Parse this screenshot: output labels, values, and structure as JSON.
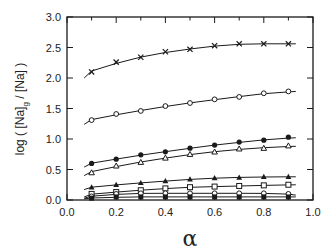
{
  "chart_data": {
    "type": "scatter",
    "title": "",
    "xlabel": "α",
    "ylabel": "log ( [Na]g / [Na] )",
    "ylabel_main": "log ( [Na]",
    "ylabel_sub": "g",
    "ylabel_tail": " / [Na] )",
    "xlim": [
      0.0,
      1.0
    ],
    "ylim": [
      0.0,
      3.0
    ],
    "xticks": [
      "0.0",
      "0.2",
      "0.4",
      "0.6",
      "0.8",
      "1.0"
    ],
    "yticks": [
      "0.0",
      "0.5",
      "1.0",
      "1.5",
      "2.0",
      "2.5",
      "3.0"
    ],
    "grid": false,
    "legend": "none",
    "x": [
      0.1,
      0.2,
      0.3,
      0.4,
      0.5,
      0.6,
      0.7,
      0.8,
      0.9
    ],
    "series": [
      {
        "name": "cross",
        "marker": "x",
        "values": [
          2.1,
          2.26,
          2.34,
          2.43,
          2.47,
          2.53,
          2.56,
          2.56,
          2.56
        ],
        "fit_start": 2.0,
        "fit_end": 2.56
      },
      {
        "name": "open-circle",
        "marker": "open-circle",
        "values": [
          1.31,
          1.41,
          1.46,
          1.54,
          1.59,
          1.65,
          1.69,
          1.75,
          1.78
        ],
        "fit_start": 1.24,
        "fit_end": 1.78
      },
      {
        "name": "filled-circle",
        "marker": "filled-circle",
        "values": [
          0.6,
          0.67,
          0.74,
          0.79,
          0.85,
          0.9,
          0.95,
          0.98,
          1.03
        ],
        "fit_start": 0.54,
        "fit_end": 1.02
      },
      {
        "name": "open-triangle",
        "marker": "open-triangle",
        "values": [
          0.45,
          0.56,
          0.62,
          0.69,
          0.75,
          0.79,
          0.84,
          0.85,
          0.89
        ],
        "fit_start": 0.4,
        "fit_end": 0.88
      },
      {
        "name": "filled-triangle",
        "marker": "filled-triangle",
        "values": [
          0.21,
          0.25,
          0.28,
          0.31,
          0.34,
          0.36,
          0.37,
          0.38,
          0.38
        ],
        "fit_start": 0.17,
        "fit_end": 0.38
      },
      {
        "name": "open-square",
        "marker": "open-square",
        "values": [
          0.1,
          0.13,
          0.16,
          0.19,
          0.21,
          0.22,
          0.23,
          0.24,
          0.25
        ],
        "fit_start": 0.05,
        "fit_end": 0.25
      },
      {
        "name": "open-circle-low",
        "marker": "open-circle-small",
        "values": [
          0.06,
          0.1,
          0.11,
          0.11,
          0.11,
          0.11,
          0.11,
          0.11,
          0.1
        ],
        "fit_start": 0.03,
        "fit_end": 0.08
      },
      {
        "name": "filled-square",
        "marker": "filled-square",
        "values": [
          0.03,
          0.05,
          0.05,
          0.05,
          0.05,
          0.05,
          0.05,
          0.05,
          0.05
        ],
        "fit_start": 0.02,
        "fit_end": 0.05
      }
    ]
  },
  "colors": {
    "ink": "#1a1a1a",
    "background": "#ffffff"
  }
}
